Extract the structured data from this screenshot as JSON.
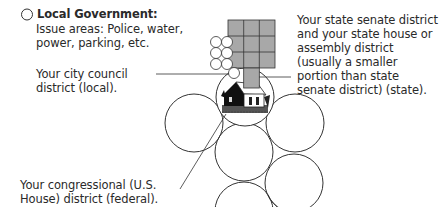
{
  "section": {
    "radio_label": "Local Government:",
    "issue_areas": "Issue areas: Police, water, power, parking, etc."
  },
  "labels": {
    "city_council": "Your city council district (local).",
    "state": "Your state senate district and your state house or assembly district (usually a smaller portion than state senate district) (state).",
    "congressional": "Your congressional (U.S. House) district (federal)."
  },
  "colors": {
    "grid_fill": "#a8a8a8",
    "stroke": "#333333",
    "text": "#2a2a2a"
  },
  "illustration": {
    "icon": "house-icon"
  }
}
